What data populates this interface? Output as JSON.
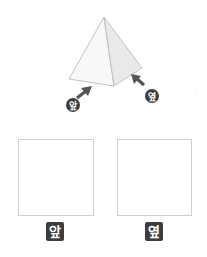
{
  "figure": {
    "view_badges": [
      {
        "label": "앞",
        "cx": 73,
        "cy": 105
      },
      {
        "label": "옆",
        "cx": 152,
        "cy": 96
      }
    ],
    "colors": {
      "badge": "#3d3d3d",
      "arrow": "#555555",
      "pyramid_edge": "#b5b5b5",
      "front_face": "#f7f7f7",
      "side_face": "#e8e8e8"
    }
  },
  "answer_boxes": [
    {
      "label": "앞"
    },
    {
      "label": "옆"
    }
  ]
}
